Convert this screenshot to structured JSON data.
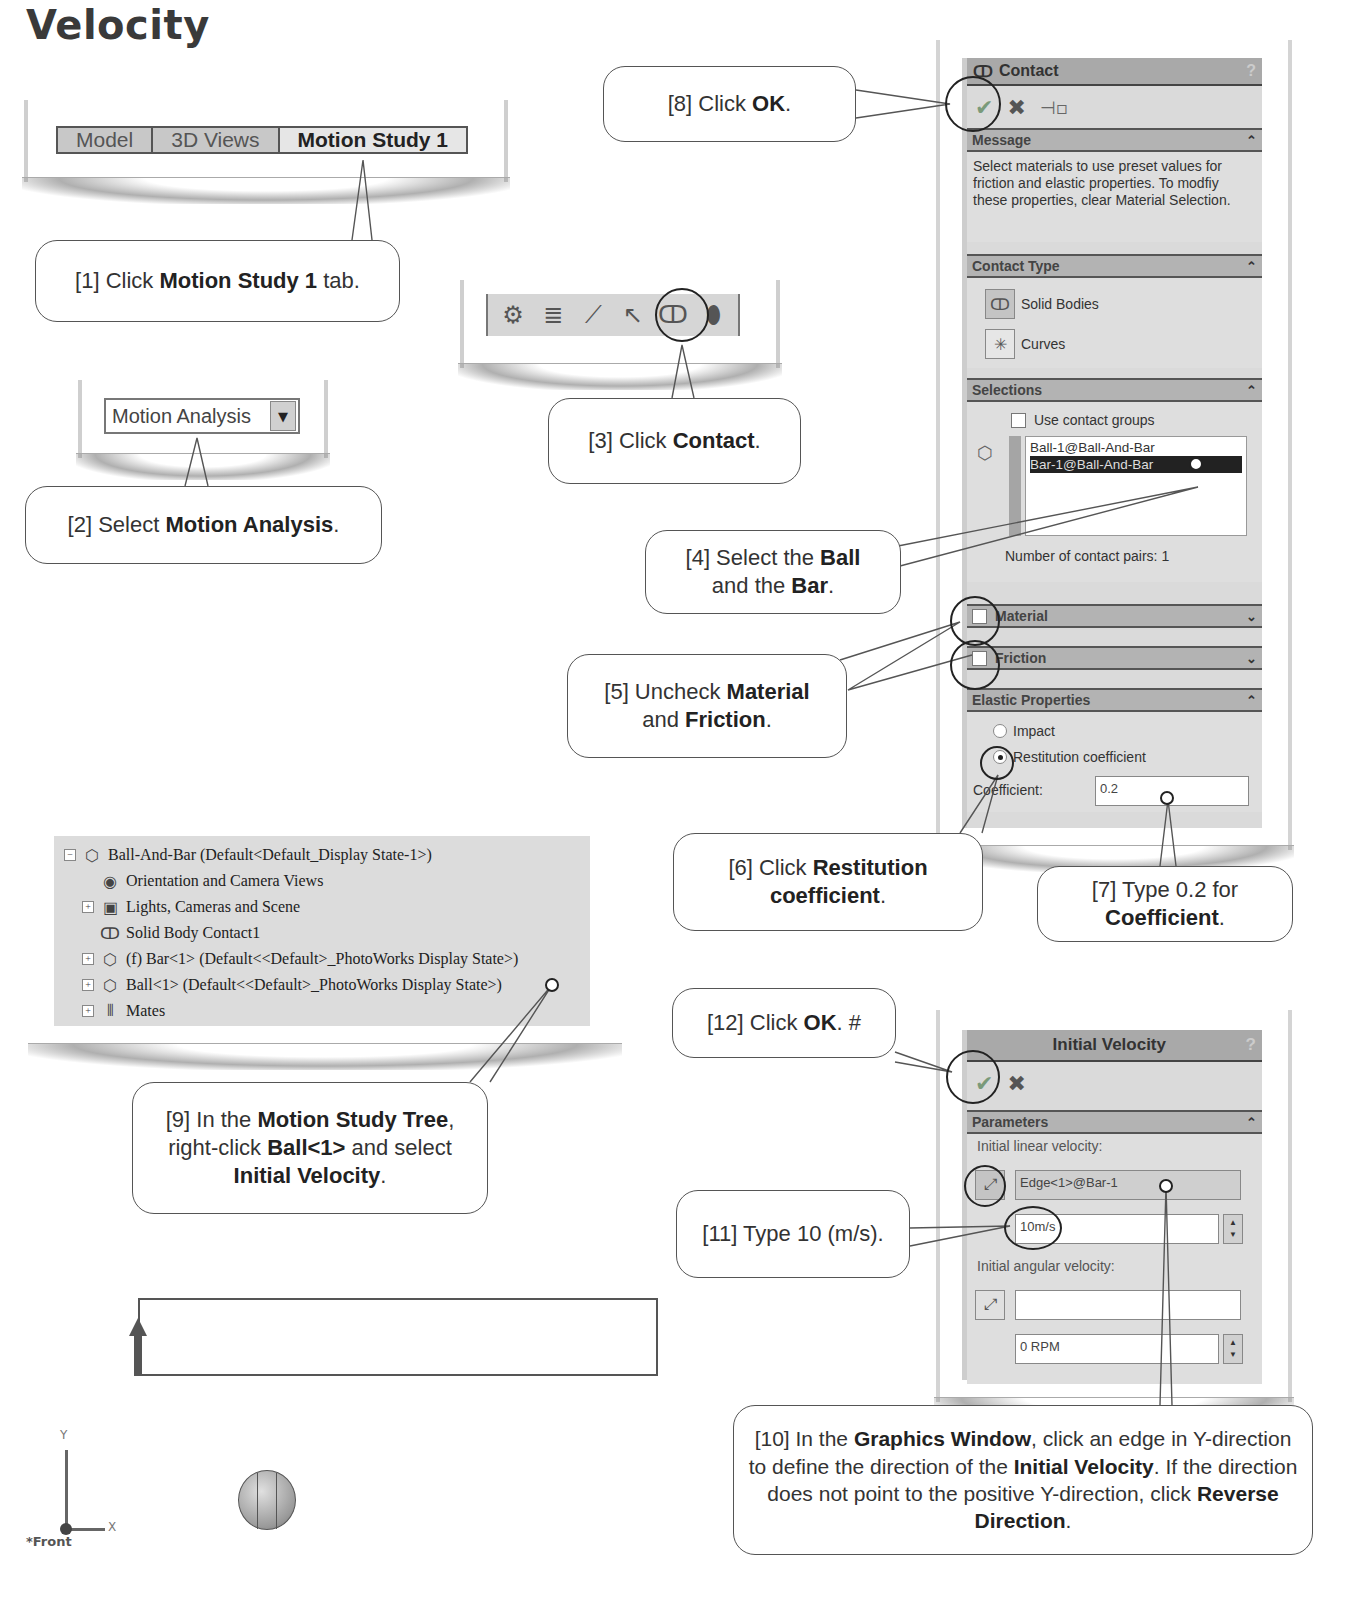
{
  "page": {
    "title": "Velocity"
  },
  "tabs": [
    {
      "label": "Model",
      "active": false
    },
    {
      "label": "3D Views",
      "active": false
    },
    {
      "label": "Motion Study 1",
      "active": true
    }
  ],
  "toolbar": {
    "icons": [
      "motor-icon",
      "spring-icon",
      "damper-icon",
      "force-icon",
      "contact-icon",
      "gravity-icon"
    ],
    "glyphs": [
      "⚙",
      "≣",
      "⟋",
      "↖",
      "ↀ",
      "⬮"
    ]
  },
  "study_type_dropdown": {
    "value": "Motion Analysis",
    "arrow": "▼"
  },
  "contact_panel": {
    "title": "Contact",
    "help": "?",
    "actions": {
      "ok": "✔",
      "cancel": "✖",
      "pin": "⊣▫"
    },
    "message": {
      "header": "Message",
      "text": "Select materials to use preset values for friction and elastic properties. To modfiy these properties, clear Material Selection."
    },
    "contact_type": {
      "header": "Contact Type",
      "options": [
        {
          "label": "Solid Bodies",
          "glyph": "ↀ"
        },
        {
          "label": "Curves",
          "glyph": "✳"
        }
      ]
    },
    "selections": {
      "header": "Selections",
      "use_contact_groups": "Use contact groups",
      "items": [
        {
          "label": "Ball-1@Ball-And-Bar",
          "selected": false
        },
        {
          "label": "Bar-1@Ball-And-Bar",
          "selected": true
        }
      ],
      "pairs_label": "Number of contact pairs: 1"
    },
    "material": {
      "label": "Material",
      "checked": false
    },
    "friction": {
      "label": "Friction",
      "checked": false
    },
    "elastic": {
      "header": "Elastic Properties",
      "options": [
        {
          "label": "Impact",
          "on": false
        },
        {
          "label": "Restitution coefficient",
          "on": true
        }
      ],
      "coefficient_label": "Coefficient:",
      "coefficient_value": "0.2"
    },
    "chev_up": "⌃",
    "chev_down": "⌄"
  },
  "tree": {
    "rows": [
      {
        "sign": "−",
        "icon": "⬡",
        "label": "Ball-And-Bar  (Default<Default_Display State-1>)",
        "indent": 0
      },
      {
        "sign": "",
        "icon": "◉",
        "label": "Orientation and Camera Views",
        "indent": 1
      },
      {
        "sign": "+",
        "icon": "▣",
        "label": "Lights, Cameras and Scene",
        "indent": 1
      },
      {
        "sign": "",
        "icon": "ↀ",
        "label": "Solid Body Contact1",
        "indent": 1
      },
      {
        "sign": "+",
        "icon": "⬡",
        "label": "(f) Bar<1> (Default<<Default>_PhotoWorks Display State>)",
        "indent": 1
      },
      {
        "sign": "+",
        "icon": "⬡",
        "label": "Ball<1> (Default<<Default>_PhotoWorks Display State>)",
        "indent": 1
      },
      {
        "sign": "+",
        "icon": "⫴",
        "label": "Mates",
        "indent": 1
      }
    ]
  },
  "velocity_panel": {
    "title": "Initial Velocity",
    "help": "?",
    "actions": {
      "ok": "✔",
      "cancel": "✖"
    },
    "parameters_header": "Parameters",
    "linear_label": "Initial linear velocity:",
    "linear_ref": "Edge<1>@Bar-1",
    "linear_value": "10m/s",
    "angular_label": "Initial angular velocity:",
    "angular_ref": "",
    "angular_value": "0 RPM",
    "direction_glyph": "⤢",
    "spin_up": "▲",
    "spin_down": "▼"
  },
  "graphics": {
    "axis_y": "Y",
    "axis_x": "X",
    "view_label": "*Front"
  },
  "callouts": {
    "c1": [
      "[1] Click ",
      "Motion Study 1",
      " tab."
    ],
    "c2": [
      "[2] Select ",
      "Motion Analysis",
      "."
    ],
    "c3": [
      "[3] Click ",
      "Contact",
      "."
    ],
    "c4": [
      "[4] Select the ",
      "Ball",
      " and the ",
      "Bar",
      "."
    ],
    "c5": [
      "[5] Uncheck ",
      "Material",
      " and ",
      "Friction",
      "."
    ],
    "c6": [
      "[6] Click ",
      "Restitution coefficient",
      "."
    ],
    "c7": [
      "[7] Type 0.2 for ",
      "Coefficient",
      "."
    ],
    "c8": [
      "[8]  Click ",
      "OK",
      "."
    ],
    "c9": [
      "[9] In the ",
      "Motion Study Tree",
      ", right-click ",
      "Ball<1>",
      " and select ",
      "Initial Velocity",
      "."
    ],
    "c10": [
      "[10] In the ",
      "Graphics Window",
      ", click an edge in Y-direction to define the direction of the ",
      "Initial Velocity",
      ".  If the direction does not point to the positive Y-direction, click ",
      "Reverse Direction",
      "."
    ],
    "c11": [
      "[11] Type 10 (m/s)."
    ],
    "c12": [
      "[12] Click ",
      "OK",
      ". #"
    ]
  }
}
